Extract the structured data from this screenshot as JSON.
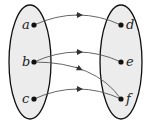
{
  "diagram": {
    "type": "mapping",
    "domain_set": {
      "elements": [
        "a",
        "b",
        "c"
      ]
    },
    "codomain_set": {
      "elements": [
        "d",
        "e",
        "f"
      ]
    },
    "arrows": [
      {
        "from": "a",
        "to": "d"
      },
      {
        "from": "b",
        "to": "e"
      },
      {
        "from": "b",
        "to": "f"
      },
      {
        "from": "c",
        "to": "f"
      }
    ],
    "colors": {
      "set_fill": "#ececec",
      "outline": "#111111",
      "arrow": "#555555",
      "dot": "#111111"
    }
  }
}
